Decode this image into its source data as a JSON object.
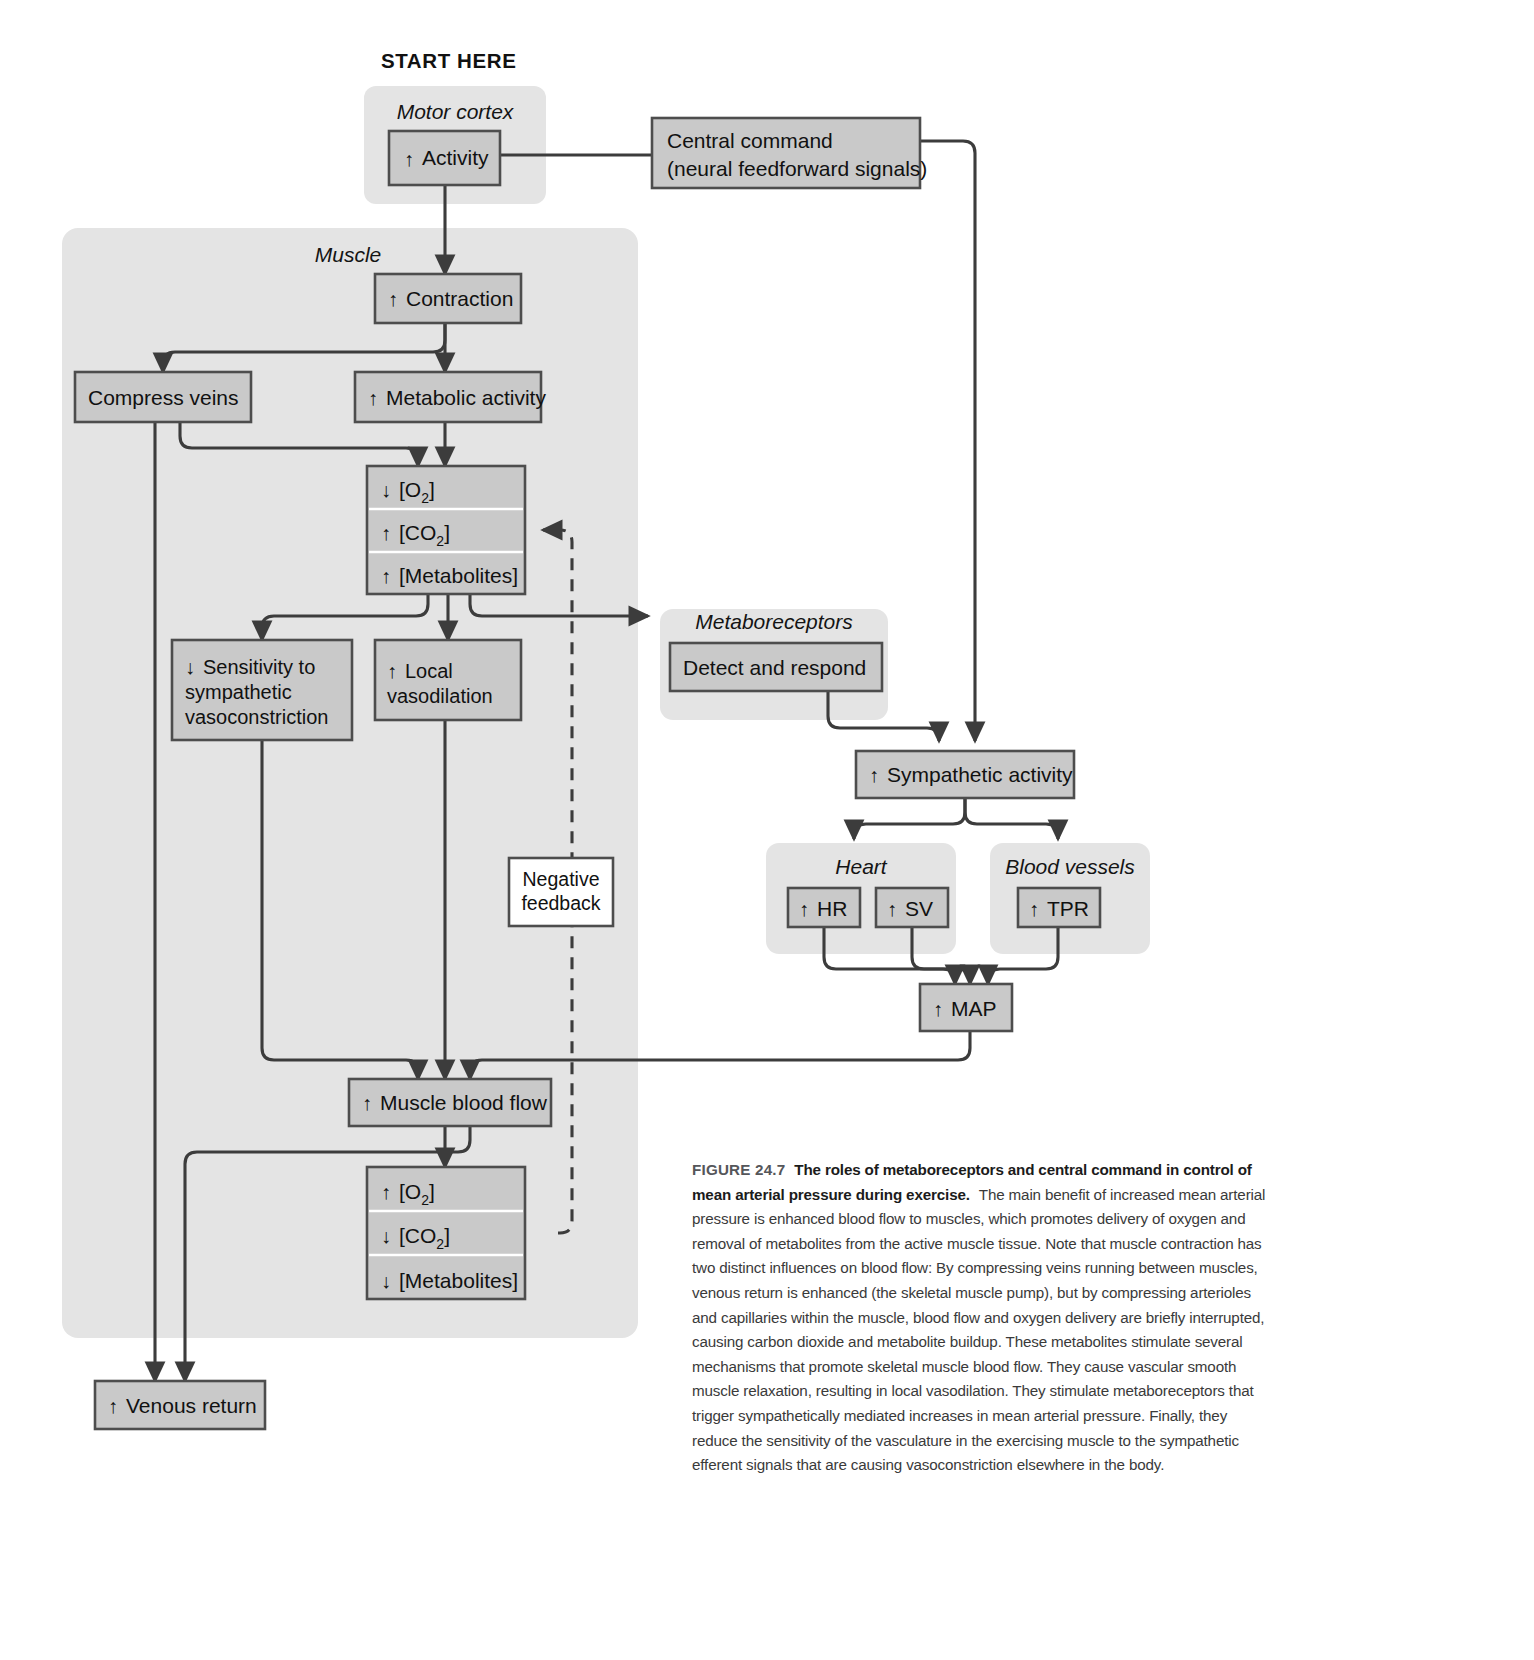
{
  "figure": {
    "start_label": "START HERE",
    "negative_feedback": [
      "Negative",
      "feedback"
    ],
    "groups": {
      "motor_cortex": "Motor cortex",
      "muscle": "Muscle",
      "metaboreceptors": "Metaboreceptors",
      "heart": "Heart",
      "blood_vessels": "Blood vessels"
    },
    "boxes": {
      "activity": {
        "dir": "up",
        "label": "Activity"
      },
      "central_command": {
        "line1": "Central command",
        "line2": "(neural feedforward signals)"
      },
      "contraction": {
        "dir": "up",
        "label": "Contraction"
      },
      "compress_veins": {
        "dir": "none",
        "label": "Compress veins"
      },
      "metabolic_activity": {
        "dir": "up",
        "label": "Metabolic activity"
      },
      "muscle_chem_up": [
        {
          "dir": "down",
          "label": "[O",
          "sub": "2",
          "tail": "]"
        },
        {
          "dir": "up",
          "label": "[CO",
          "sub": "2",
          "tail": "]"
        },
        {
          "dir": "up",
          "label": "[Metabolites]",
          "sub": "",
          "tail": ""
        }
      ],
      "sensitivity": {
        "dir": "down",
        "line1": "Sensitivity to",
        "line2": "sympathetic",
        "line3": "vasoconstriction"
      },
      "local_vasodilation": {
        "dir": "up",
        "line1": "Local",
        "line2": "vasodilation"
      },
      "detect_respond": {
        "dir": "none",
        "label": "Detect and respond"
      },
      "sympathetic_activity": {
        "dir": "up",
        "label": "Sympathetic activity"
      },
      "hr": {
        "dir": "up",
        "label": "HR"
      },
      "sv": {
        "dir": "up",
        "label": "SV"
      },
      "tpr": {
        "dir": "up",
        "label": "TPR"
      },
      "map": {
        "dir": "up",
        "label": "MAP"
      },
      "muscle_blood_flow": {
        "dir": "up",
        "label": "Muscle blood flow"
      },
      "muscle_chem_down": [
        {
          "dir": "up",
          "label": "[O",
          "sub": "2",
          "tail": "]"
        },
        {
          "dir": "down",
          "label": "[CO",
          "sub": "2",
          "tail": "]"
        },
        {
          "dir": "down",
          "label": "[Metabolites]",
          "sub": "",
          "tail": ""
        }
      ],
      "venous_return": {
        "dir": "up",
        "label": "Venous return"
      }
    },
    "colors": {
      "box_fill": "#c9c9c9",
      "box_stroke": "#4d4d4d",
      "group_fill": "#e4e4e4",
      "panel_fill": "#e4e4e4",
      "line": "#3c3c3c",
      "white_box_fill": "#ffffff",
      "text": "#111111"
    }
  },
  "caption": {
    "fig_number": "FIGURE 24.7",
    "title": "The roles of metaboreceptors and central command in control of mean arterial pressure during exercise.",
    "body": "The main benefit of increased mean arterial pressure is enhanced blood flow to muscles, which promotes delivery of oxygen and removal of metabolites from the active muscle tissue. Note that muscle contraction has two distinct influences on blood flow: By compressing veins running between muscles, venous return is enhanced (the skeletal muscle pump), but by compressing arterioles and capillaries within the muscle, blood flow and oxygen delivery are briefly interrupted, causing carbon dioxide and metabolite buildup. These metabolites stimulate several mechanisms that promote skeletal muscle blood flow. They cause vascular smooth muscle relaxation, resulting in local vasodilation. They stimulate metaboreceptors that trigger sympathetically mediated increases in mean arterial pressure. Finally, they reduce the sensitivity of the vasculature in the exercising muscle to the sympathetic efferent signals that are causing vasoconstriction elsewhere in the body."
  }
}
